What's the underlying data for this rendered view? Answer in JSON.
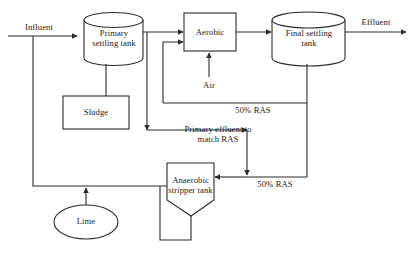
{
  "diagram": {
    "stroke_color": "#2b2b2b",
    "fill_color": "#ffffff",
    "nodes": [
      {
        "id": "primary-settling-tank",
        "label": "Primary\nsettling tank",
        "shape": "cylinder"
      },
      {
        "id": "sludge",
        "label": "Sludge",
        "shape": "rectangle"
      },
      {
        "id": "aerobic",
        "label": "Aerobic",
        "shape": "rectangle"
      },
      {
        "id": "final-settling-tank",
        "label": "Final settling\ntank",
        "shape": "cylinder"
      },
      {
        "id": "anaerobic-stripper-tank",
        "label": "Anaerobic\nstripper tank",
        "shape": "hopper"
      },
      {
        "id": "lime",
        "label": "Lime",
        "shape": "ellipse"
      }
    ],
    "flow_labels": [
      {
        "id": "influent",
        "label": "Influent"
      },
      {
        "id": "effluent",
        "label": "Effluent"
      },
      {
        "id": "air",
        "label": "Air"
      },
      {
        "id": "ras-upper",
        "label": "50% RAS"
      },
      {
        "id": "ras-lower",
        "label": "50% RAS"
      },
      {
        "id": "primary-effluent",
        "label": "Primary effluent to\nmatch RAS"
      }
    ]
  }
}
